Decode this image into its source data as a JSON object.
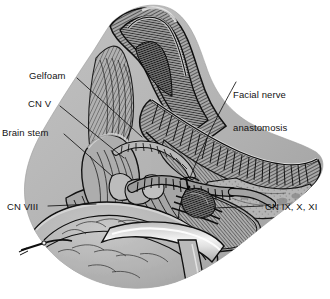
{
  "figure": {
    "kind": "medical-surgical-illustration",
    "background_color": "#ffffff",
    "tissue_fill": "#b5b5b5",
    "tissue_shadow": "#8e8e8e",
    "tissue_highlight": "#d2d2d2",
    "ink_color": "#151515",
    "label_color": "#131313"
  },
  "labels": {
    "gelfoam": "Gelfoam",
    "cn_v": "CN V",
    "brain_stem": "Brain stem",
    "cn_viii": "CN VIII",
    "cn_ix_x_xi": "CN IX, X, XI",
    "facial_nerve_line1": "Facial nerve",
    "facial_nerve_line2": "anastomosis"
  },
  "structures": [
    {
      "name": "retracted-dural-flap",
      "region": "top-apex"
    },
    {
      "name": "tentorium-edge",
      "region": "upper-right"
    },
    {
      "name": "cerebellar-surface",
      "region": "lower-left"
    },
    {
      "name": "petrous-bone-shelf",
      "region": "right"
    },
    {
      "name": "facial-nerve-graft",
      "region": "center"
    },
    {
      "name": "lower-cranial-nerves",
      "region": "lower-right"
    },
    {
      "name": "suction-tip",
      "region": "left-margin"
    },
    {
      "name": "retractor-blade",
      "region": "bottom-center"
    }
  ]
}
